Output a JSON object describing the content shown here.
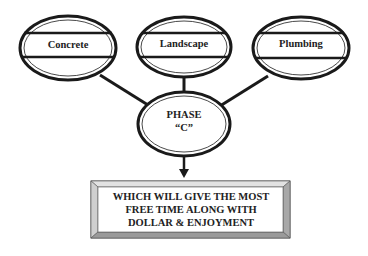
{
  "diagram": {
    "categories": [
      {
        "label": "Concrete",
        "cx": 68,
        "cy": 48
      },
      {
        "label": "Landscape",
        "cx": 184,
        "cy": 47
      },
      {
        "label": "Plumbing",
        "cx": 301,
        "cy": 48
      }
    ],
    "phase": {
      "line1": "PHASE",
      "line2": "“C”"
    },
    "result_box": {
      "lines": [
        "WHICH WILL GIVE THE MOST",
        "FREE TIME ALONG WITH",
        "DOLLAR & ENJOYMENT"
      ]
    },
    "colors": {
      "stroke": "#1a1a1a",
      "bevel_light": "#d8d8d8",
      "bevel_dark": "#9a9a9a",
      "text": "#222222"
    }
  }
}
